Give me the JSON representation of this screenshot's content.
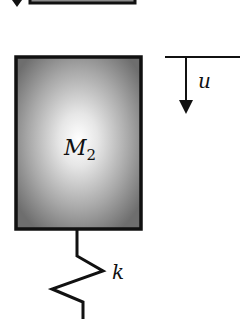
{
  "diagram": {
    "mass_label": "M",
    "mass_subscript": "2",
    "spring_label": "k",
    "displacement_label": "u",
    "colors": {
      "stroke": "#111111",
      "mass_center": "#ffffff",
      "mass_edge": "#6e6e6e",
      "background": "#ffffff"
    }
  }
}
